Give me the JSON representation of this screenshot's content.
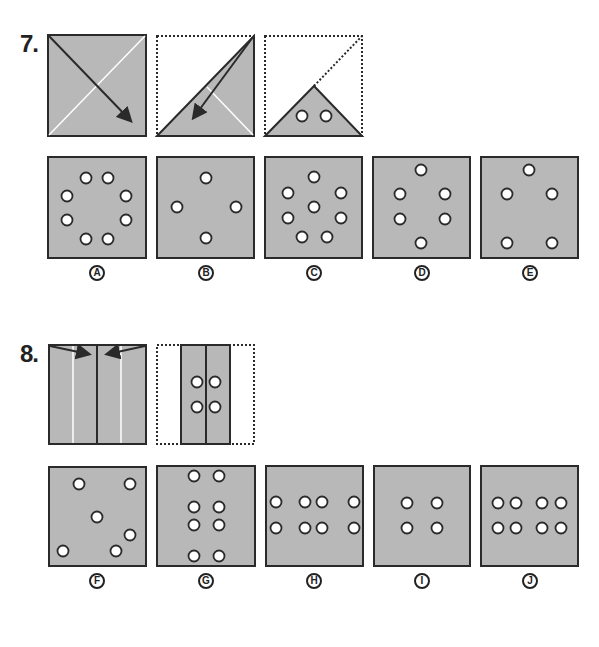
{
  "colors": {
    "paper_fill": "#b8b8b8",
    "outline": "#2a2a2a",
    "hole_fill": "#ffffff",
    "fold_line": "#ffffff",
    "background": "#ffffff"
  },
  "questions": [
    {
      "number": "7.",
      "steps": [
        {
          "name": "square-with-diagonal-fold-arrow",
          "description": "full square with white diagonals, arrow from top-left to bottom-right"
        },
        {
          "name": "folded-triangle-with-arrow",
          "description": "square folded along diagonal; lower-right triangle shaded, arrow folding top-right corner down-left"
        },
        {
          "name": "punched-small-triangle",
          "description": "small triangle with two punched holes"
        }
      ],
      "options": [
        {
          "label": "A",
          "holes": [
            [
              86,
              178
            ],
            [
              108,
              178
            ],
            [
              67,
              196
            ],
            [
              126,
              196
            ],
            [
              67,
              220
            ],
            [
              126,
              220
            ],
            [
              86,
              239
            ],
            [
              108,
              239
            ]
          ]
        },
        {
          "label": "B",
          "holes": [
            [
              206,
              178
            ],
            [
              177,
              207
            ],
            [
              236,
              207
            ],
            [
              206,
              238
            ]
          ]
        },
        {
          "label": "C",
          "holes": [
            [
              314,
              177
            ],
            [
              288,
              193
            ],
            [
              341,
              193
            ],
            [
              314,
              207
            ],
            [
              288,
              218
            ],
            [
              341,
              218
            ],
            [
              302,
              237
            ],
            [
              327,
              237
            ]
          ]
        },
        {
          "label": "D",
          "holes": [
            [
              421,
              170
            ],
            [
              400,
              194
            ],
            [
              445,
              194
            ],
            [
              400,
              219
            ],
            [
              445,
              219
            ],
            [
              421,
              243
            ]
          ]
        },
        {
          "label": "E",
          "holes": [
            [
              529,
              170
            ],
            [
              507,
              194
            ],
            [
              552,
              194
            ],
            [
              507,
              243
            ],
            [
              552,
              243
            ]
          ]
        }
      ]
    },
    {
      "number": "8.",
      "steps": [
        {
          "name": "square-with-side-folds",
          "description": "square with center line and two white fold lines, arrows folding sides inward"
        },
        {
          "name": "folded-strip-punched",
          "description": "sides folded to center, four punched holes"
        }
      ],
      "options": [
        {
          "label": "F",
          "holes": [
            [
              79,
              484
            ],
            [
              130,
              484
            ],
            [
              97,
              517
            ],
            [
              130,
              535
            ],
            [
              63,
              551
            ],
            [
              116,
              551
            ]
          ]
        },
        {
          "label": "G",
          "holes": [
            [
              194,
              476
            ],
            [
              219,
              476
            ],
            [
              194,
              507
            ],
            [
              219,
              507
            ],
            [
              194,
              525
            ],
            [
              219,
              525
            ],
            [
              194,
              556
            ],
            [
              219,
              556
            ]
          ]
        },
        {
          "label": "H",
          "holes": [
            [
              276,
              502
            ],
            [
              305,
              502
            ],
            [
              322,
              502
            ],
            [
              354,
              502
            ],
            [
              276,
              528
            ],
            [
              305,
              528
            ],
            [
              322,
              528
            ],
            [
              354,
              528
            ]
          ]
        },
        {
          "label": "I",
          "holes": [
            [
              407,
              503
            ],
            [
              437,
              503
            ],
            [
              407,
              528
            ],
            [
              437,
              528
            ]
          ]
        },
        {
          "label": "J",
          "holes": [
            [
              498,
              503
            ],
            [
              516,
              503
            ],
            [
              542,
              503
            ],
            [
              561,
              503
            ],
            [
              498,
              528
            ],
            [
              516,
              528
            ],
            [
              542,
              528
            ],
            [
              561,
              528
            ]
          ]
        }
      ]
    }
  ]
}
